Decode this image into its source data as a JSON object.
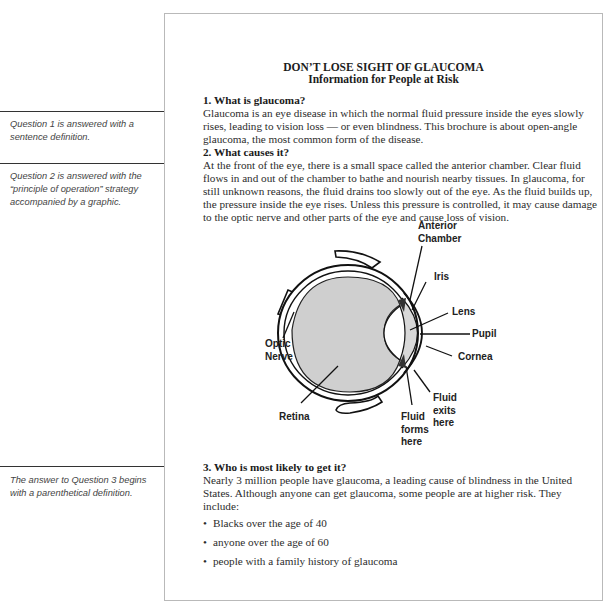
{
  "document": {
    "title": "DON’T LOSE SIGHT OF GLAUCOMA",
    "subtitle": "Information for People at Risk",
    "sections": [
      {
        "heading": "1. What is glaucoma?",
        "body": "Glaucoma is an eye disease in which the normal fluid pressure inside the eyes slowly rises, leading to vision loss — or even blindness. This brochure is about open-angle glaucoma, the most common form of the disease."
      },
      {
        "heading": "2. What causes it?",
        "body": "At the front of the eye, there is a small space called the anterior chamber. Clear fluid flows in and out of the chamber to bathe and nourish nearby tissues. In glaucoma, for still unknown reasons, the fluid drains too slowly out of the eye. As the fluid builds up, the pressure inside the eye rises. Unless this pressure is controlled, it may cause damage to the optic nerve and other parts of the eye and cause loss of vision."
      },
      {
        "heading": "3. Who is most likely to get it?",
        "body": "Nearly 3 million people have glaucoma, a leading cause of blindness in the United States. Although anyone can get glaucoma, some people are at higher risk. They include:",
        "bullets": [
          "Blacks over the age of 40",
          "anyone over the age of 60",
          "people with a family history of glaucoma"
        ]
      }
    ]
  },
  "diagram": {
    "labels": {
      "anterior_chamber_1": "Anterior",
      "anterior_chamber_2": "Chamber",
      "iris": "Iris",
      "lens": "Lens",
      "pupil": "Pupil",
      "cornea": "Cornea",
      "optic_nerve_1": "Optic",
      "optic_nerve_2": "Nerve",
      "retina": "Retina",
      "fluid_forms_1": "Fluid",
      "fluid_forms_2": "forms",
      "fluid_forms_3": "here",
      "fluid_exits_1": "Fluid",
      "fluid_exits_2": "exits",
      "fluid_exits_3": "here"
    }
  },
  "annotations": [
    "Question 1 is answered with a sentence definition.",
    "Question 2 is answered with the “principle of operation” strategy accompanied by a graphic.",
    "The answer to Question 3 begins with a parenthetical definition."
  ]
}
